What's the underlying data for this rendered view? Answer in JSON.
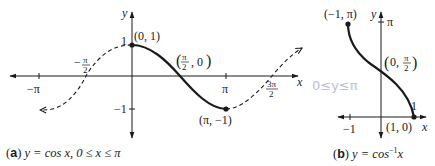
{
  "figure": {
    "panel_a": {
      "caption_letter": "a",
      "caption_text": "y = cos x, 0 ≤ x ≤ π",
      "axis_x_label": "x",
      "axis_y_label": "y",
      "x_ticks": [
        "−π",
        "−π/2",
        "π",
        "3π/2"
      ],
      "y_ticks": [
        "1",
        "−1"
      ],
      "points": [
        {
          "label": "(0, 1)",
          "x": 0,
          "y": 1
        },
        {
          "label": "(π/2, 0)",
          "x": 1.5708,
          "y": 0
        },
        {
          "label": "(π, −1)",
          "x": 3.1416,
          "y": -1
        }
      ],
      "solid_segment": "0 ≤ x ≤ π",
      "dashed_segment": "rest of cos x from about −π to 3π/2"
    },
    "panel_b": {
      "caption_letter": "b",
      "caption_text": "y = cos⁻¹x",
      "axis_x_label": "x",
      "axis_y_label": "y",
      "x_ticks": [
        "−1",
        "1"
      ],
      "y_ticks": [
        "π"
      ],
      "points": [
        {
          "label": "(−1, π)",
          "x": -1,
          "y": 3.1416
        },
        {
          "label": "(0, π/2)",
          "x": 0,
          "y": 1.5708
        },
        {
          "label": "(1, 0)",
          "x": 1,
          "y": 0
        }
      ]
    },
    "handwritten_note": "0≤y≤π"
  },
  "labels": {
    "a_letter": "a",
    "a_caption": "y = cos x, 0 ≤ x ≤ π",
    "b_letter": "b",
    "b_caption_pre": "y = cos",
    "b_caption_sup": "−1",
    "b_caption_post": "x",
    "pt_01": "(0, 1)",
    "pt_pi_m1": "(π, −1)",
    "pt_m1_pi": "(−1, π)",
    "pt_10": "(1, 0)",
    "tick_mpi": "−π",
    "tick_pi": "π",
    "tick_1": "1",
    "tick_m1": "−1",
    "x": "x",
    "y": "y",
    "hand": "0≤y≤π"
  }
}
